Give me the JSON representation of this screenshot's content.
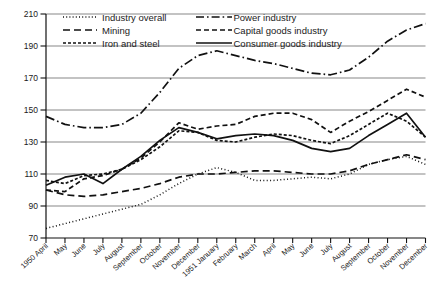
{
  "chart_data": {
    "type": "line",
    "title": "",
    "subtitle": "",
    "xlabel": "",
    "ylabel": "",
    "ylim": [
      70,
      210
    ],
    "yticks": [
      70,
      90,
      110,
      130,
      150,
      170,
      190,
      210
    ],
    "grid": true,
    "legend_position": "top-inside",
    "x": [
      "1950 April",
      "May",
      "June",
      "July",
      "August",
      "September",
      "October",
      "November",
      "December",
      "1951 January",
      "February",
      "March",
      "April",
      "May",
      "June",
      "July",
      "August",
      "September",
      "October",
      "November",
      "December"
    ],
    "categories": [
      "1950 April",
      "May",
      "June",
      "July",
      "August",
      "September",
      "October",
      "November",
      "December",
      "1951 January",
      "February",
      "March",
      "April",
      "May",
      "June",
      "July",
      "August",
      "September",
      "October",
      "November",
      "December"
    ],
    "series": [
      {
        "name": "Industry overall",
        "dash": "1,2.4",
        "width": 1.5,
        "values": [
          76,
          79,
          82,
          85,
          88,
          91,
          97,
          104,
          110,
          114,
          111,
          106,
          106,
          107,
          108,
          107,
          110,
          116,
          119,
          121,
          116
        ]
      },
      {
        "name": "Mining",
        "dash": "7,4",
        "width": 1.7,
        "values": [
          100,
          97,
          96,
          97,
          99,
          101,
          104,
          108,
          110,
          110,
          111,
          112,
          112,
          111,
          110,
          110,
          112,
          116,
          119,
          122,
          119
        ]
      },
      {
        "name": "Iron and steel",
        "dash": "3,2",
        "width": 1.7,
        "values": [
          106,
          104,
          109,
          110,
          113,
          119,
          127,
          137,
          136,
          131,
          130,
          133,
          135,
          134,
          131,
          129,
          134,
          141,
          148,
          143,
          133
        ]
      },
      {
        "name": "Power industry",
        "dash": "9,3,1.6,3",
        "width": 1.7,
        "values": [
          146,
          141,
          139,
          139,
          141,
          148,
          161,
          176,
          184,
          187,
          184,
          181,
          179,
          176,
          173,
          172,
          175,
          183,
          193,
          200,
          204
        ]
      },
      {
        "name": "Capital goods industry",
        "dash": "5,3",
        "width": 1.7,
        "values": [
          100,
          99,
          107,
          109,
          113,
          120,
          130,
          142,
          138,
          140,
          141,
          146,
          148,
          148,
          144,
          136,
          143,
          149,
          156,
          163,
          158
        ]
      },
      {
        "name": "Consumer goods industry",
        "dash": "none",
        "width": 1.7,
        "values": [
          103,
          108,
          110,
          104,
          113,
          121,
          131,
          139,
          136,
          132,
          134,
          135,
          134,
          131,
          126,
          124,
          126,
          134,
          141,
          148,
          133
        ]
      }
    ]
  },
  "legend": {
    "items": [
      {
        "label": "Industry overall",
        "pattern": "dotted"
      },
      {
        "label": "Mining",
        "pattern": "long-dash"
      },
      {
        "label": "Iron and steel",
        "pattern": "dense-dash"
      },
      {
        "label": "Power industry",
        "pattern": "dash-dot"
      },
      {
        "label": "Capital goods industry",
        "pattern": "dashed"
      },
      {
        "label": "Consumer goods industry",
        "pattern": "solid"
      }
    ]
  },
  "colors": {
    "line": "#111111",
    "grid": "#888888",
    "axis": "#111111",
    "text": "#1a1a1a",
    "background": "#ffffff"
  }
}
